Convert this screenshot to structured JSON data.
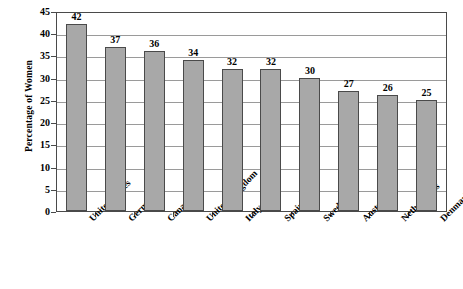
{
  "chart_data": {
    "type": "bar",
    "title": "",
    "xlabel": "",
    "ylabel": "Percentage of Women",
    "ylim": [
      0,
      45
    ],
    "ytick_step": 5,
    "yticks": [
      45,
      40,
      35,
      30,
      25,
      20,
      15,
      10,
      5,
      0
    ],
    "grid": true,
    "legend": false,
    "categories": [
      "United States",
      "Germany",
      "Canada",
      "United Kingdom",
      "Italy",
      "Spain",
      "Sweden",
      "Austria",
      "Netherlands",
      "Denmark"
    ],
    "values": [
      42,
      37,
      36,
      34,
      32,
      32,
      30,
      27,
      26,
      25
    ],
    "data_labels": [
      "42",
      "37",
      "36",
      "34",
      "32",
      "32",
      "30",
      "27",
      "26",
      "25"
    ],
    "colors": {
      "bar_fill": "#a8a8a8",
      "bar_stroke": "#4a4a4a",
      "gridline": "#9a9a9a",
      "axis": "#4a4a4a",
      "text": "#000000",
      "background": "#ffffff"
    }
  }
}
